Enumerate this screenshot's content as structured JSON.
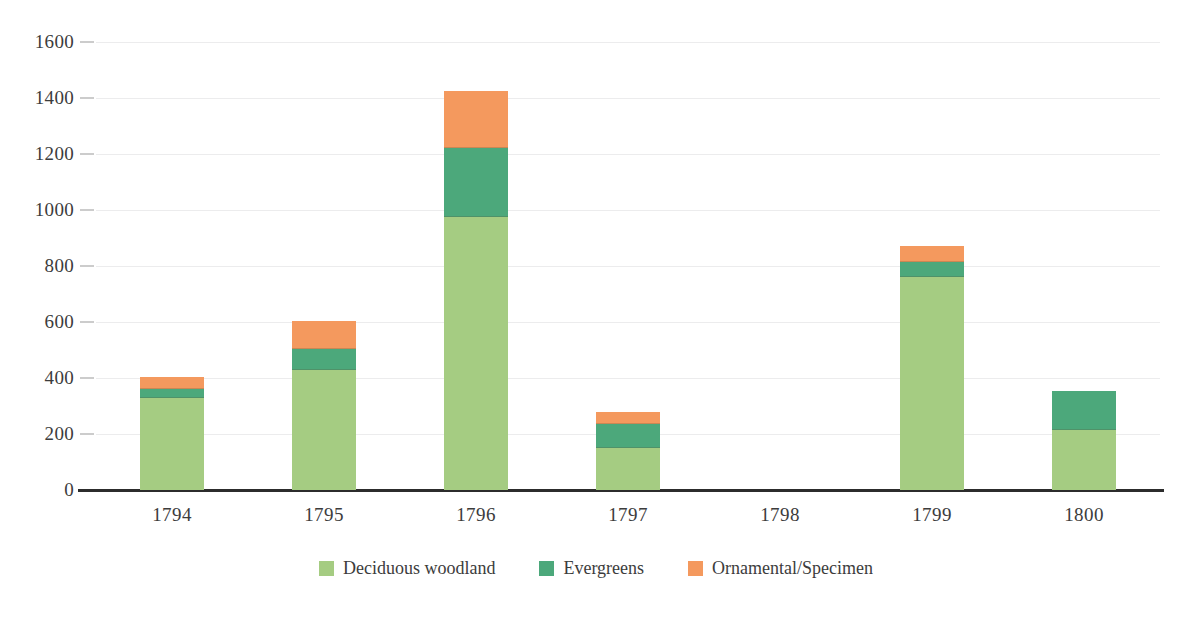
{
  "chart_data": {
    "type": "bar",
    "subtype": "stacked-vertical",
    "title": "",
    "xlabel": "",
    "ylabel": "",
    "categories": [
      "1794",
      "1795",
      "1796",
      "1797",
      "1798",
      "1799",
      "1800"
    ],
    "series": [
      {
        "name": "Deciduous woodland",
        "color": "#a5cc82",
        "values": [
          330,
          430,
          975,
          150,
          0,
          760,
          215
        ]
      },
      {
        "name": "Evergreens",
        "color": "#4ca87b",
        "values": [
          30,
          75,
          245,
          85,
          0,
          55,
          140
        ]
      },
      {
        "name": "Ornamental/Specimen",
        "color": "#f4995e",
        "values": [
          45,
          100,
          205,
          45,
          0,
          55,
          0
        ]
      }
    ],
    "totals": [
      405,
      605,
      1425,
      280,
      0,
      870,
      355
    ],
    "ylim": [
      0,
      1600
    ],
    "ytick_values": [
      0,
      200,
      400,
      600,
      800,
      1000,
      1200,
      1400,
      1600
    ],
    "ytick_labels": [
      "0",
      "200",
      "400",
      "600",
      "800",
      "1000",
      "1200",
      "1400",
      "1600"
    ],
    "grid": true,
    "grid_axis": "y",
    "legend_position": "bottom-center",
    "background_color": "#ffffff",
    "axis_line_color": "#2c2c2c",
    "gridline_color": "#ececed"
  },
  "legend": {
    "items": [
      {
        "label": "Deciduous woodland",
        "color": "#a5cc82"
      },
      {
        "label": "Evergreens",
        "color": "#4ca87b"
      },
      {
        "label": "Ornamental/Specimen",
        "color": "#f4995e"
      }
    ]
  }
}
